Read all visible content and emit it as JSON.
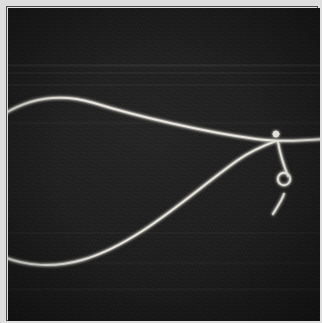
{
  "image": {
    "kind": "grayscale-micrograph",
    "subject": "bright filament with looped knot",
    "width_px": 322,
    "height_px": 323,
    "frame": {
      "margin_color": "#dedede",
      "rule_color": "#4a4a4a",
      "plate_color": "#161616"
    },
    "filament": {
      "stroke_color": "#e8e6df",
      "glow_color": "#9a978e",
      "stroke_width_px": 1.9
    },
    "background_bands": [
      {
        "top_px": 64,
        "height_px": 3,
        "label": "scan-band-upper"
      },
      {
        "top_px": 72,
        "height_px": 2,
        "label": "scan-band-upper-2"
      },
      {
        "top_px": 84,
        "height_px": 2,
        "label": "scan-band-mid-upper"
      },
      {
        "top_px": 122,
        "height_px": 2,
        "label": "scan-band-mid"
      },
      {
        "top_px": 232,
        "height_px": 2,
        "label": "scan-band-lower"
      },
      {
        "top_px": 262,
        "height_px": 2,
        "label": "scan-band-lower-2"
      },
      {
        "top_px": 288,
        "height_px": 3,
        "label": "scan-band-bottom"
      }
    ],
    "paths": {
      "upper_strand": "M -4 106 C 22 90, 52 85, 86 95 C 128 108, 196 124, 248 131 C 268 134, 292 133, 316 131",
      "lower_strand": "M -4 249 C 18 258, 46 260, 74 252 C 130 236, 182 186, 230 152 C 246 141, 260 136, 268 133",
      "knot_stem": "M 270 134 C 272 146, 276 158, 280 168",
      "knot_tail": "M 276 186 C 274 192, 270 198, 265 206"
    },
    "knot": {
      "node_center_x": 270,
      "node_center_y": 133,
      "node_radius_px": 3.1,
      "loop_center_x": 278,
      "loop_center_y": 178,
      "loop_radius_px": 6.2
    }
  }
}
